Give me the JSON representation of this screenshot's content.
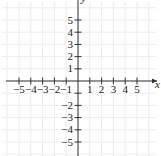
{
  "chart_data": {
    "type": "scatter",
    "title": "",
    "xlabel": "x",
    "ylabel": "y",
    "xlim": [
      -6.5,
      6.8
    ],
    "ylim": [
      -6.3,
      6.8
    ],
    "grid": true,
    "x_ticks": [
      -5,
      -4,
      -3,
      -2,
      -1,
      1,
      2,
      3,
      4,
      5
    ],
    "y_ticks": [
      5,
      4,
      3,
      2,
      1,
      -2,
      -3,
      -4,
      -5
    ],
    "x_tick_labels": [
      "−5",
      "−4",
      "−3",
      "−2",
      "−1",
      "1",
      "2",
      "3",
      "4",
      "5"
    ],
    "y_tick_labels": [
      "5",
      "4",
      "3",
      "2",
      "1",
      "−2",
      "−3",
      "−4",
      "−5"
    ],
    "series": [],
    "legend": null
  },
  "colors": {
    "axis": "#333333",
    "grid": "#ececec",
    "text": "#222222"
  }
}
